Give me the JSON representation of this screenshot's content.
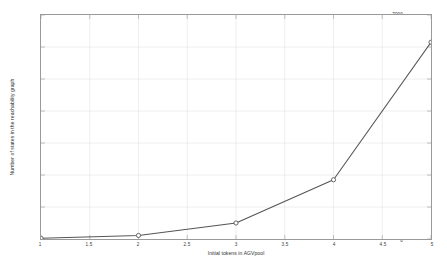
{
  "chart_data": {
    "type": "line",
    "title": "",
    "xlabel": "Initial tokens in AGVpool",
    "ylabel": "Number of states in the reachability graph",
    "xlim": [
      1,
      5
    ],
    "ylim": [
      0,
      7000
    ],
    "xticks": [
      1,
      1.5,
      2,
      2.5,
      3,
      3.5,
      4,
      4.5,
      5
    ],
    "xtick_labels": [
      "1",
      "1.5",
      "2",
      "2.5",
      "3",
      "3.5",
      "4",
      "4.5",
      "5"
    ],
    "yticks": [
      0,
      1000,
      2000,
      3000,
      4000,
      5000,
      6000,
      7000
    ],
    "ytick_labels": [
      "0",
      "1000",
      "2000",
      "3000",
      "4000",
      "5000",
      "6000",
      "7000"
    ],
    "grid": true,
    "legend": null,
    "x": [
      1,
      2,
      3,
      4,
      5
    ],
    "values": [
      24,
      110,
      500,
      1850,
      6150
    ],
    "series": [
      {
        "name": "states",
        "x": [
          1,
          2,
          3,
          4,
          5
        ],
        "values": [
          24,
          110,
          500,
          1850,
          6150
        ],
        "line_color": "#555555",
        "marker": "circle",
        "marker_color": "#555555"
      }
    ],
    "colors": {
      "line": "#555555",
      "marker_edge": "#555555",
      "marker_face": "#ffffff",
      "grid": "#e2e2e2",
      "axis": "#9a9a9a",
      "background": "#ffffff",
      "text": "#3a3a3a"
    }
  }
}
